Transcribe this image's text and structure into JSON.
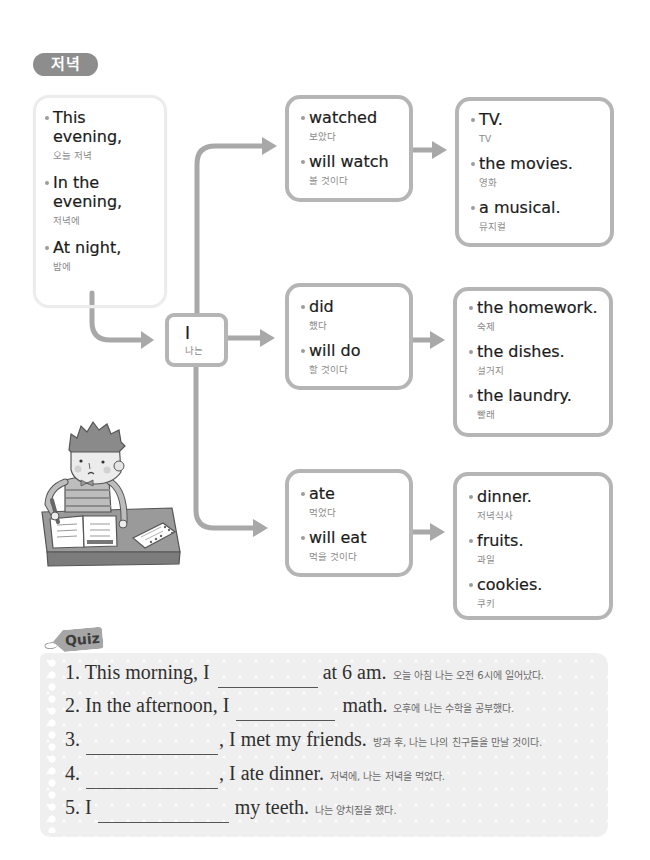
{
  "section_tag": "저녁",
  "time_box": {
    "items": [
      {
        "en": "This evening,",
        "ko": "오늘 저녁"
      },
      {
        "en": "In the evening,",
        "ko": "저녁에"
      },
      {
        "en": "At night,",
        "ko": "밤에"
      }
    ]
  },
  "subject_box": {
    "en": "I",
    "ko": "나는"
  },
  "branches": [
    {
      "verbs": [
        {
          "en": "watched",
          "ko": "보았다"
        },
        {
          "en": "will watch",
          "ko": "볼 것이다"
        }
      ],
      "objects": [
        {
          "en": "TV.",
          "ko": "TV"
        },
        {
          "en": "the movies.",
          "ko": "영화"
        },
        {
          "en": "a musical.",
          "ko": "뮤지컬"
        }
      ]
    },
    {
      "verbs": [
        {
          "en": "did",
          "ko": "했다"
        },
        {
          "en": "will do",
          "ko": "할 것이다"
        }
      ],
      "objects": [
        {
          "en": "the homework.",
          "ko": "숙제"
        },
        {
          "en": "the dishes.",
          "ko": "설거지"
        },
        {
          "en": "the laundry.",
          "ko": "빨래"
        }
      ]
    },
    {
      "verbs": [
        {
          "en": "ate",
          "ko": "먹었다"
        },
        {
          "en": "will eat",
          "ko": "먹을 것이다"
        }
      ],
      "objects": [
        {
          "en": "dinner.",
          "ko": "저녁식사"
        },
        {
          "en": "fruits.",
          "ko": "과일"
        },
        {
          "en": "cookies.",
          "ko": "쿠키"
        }
      ]
    }
  ],
  "illustration": {
    "icon": "boy-studying-at-desk"
  },
  "quiz": {
    "label": "Quiz",
    "questions": [
      {
        "prefix": "1. This morning, I",
        "blank_value": "",
        "suffix": "at 6 am.",
        "translation": "오늘 아침 나는 오전 6시에 일어났다."
      },
      {
        "prefix": "2. In the afternoon, I",
        "blank_value": "",
        "suffix": "math.",
        "translation": "오후에 나는 수학을 공부했다."
      },
      {
        "prefix": "3.",
        "blank_value": "",
        "suffix": ", I met my friends.",
        "translation": "방과 후, 나는 나의 친구들을 만날 것이다."
      },
      {
        "prefix": "4.",
        "blank_value": "",
        "suffix": ", I ate dinner.",
        "translation": "저녁에, 나는 저녁을 먹었다."
      },
      {
        "prefix": "5. I",
        "blank_value": "",
        "suffix": "my teeth.",
        "translation": "나는 양치질을 했다."
      }
    ]
  },
  "colors": {
    "box_border": "#b5b5b5",
    "connector": "#a6a6a6",
    "tag_bg": "#8d8d8d",
    "quiz_bg": "#efefef"
  }
}
